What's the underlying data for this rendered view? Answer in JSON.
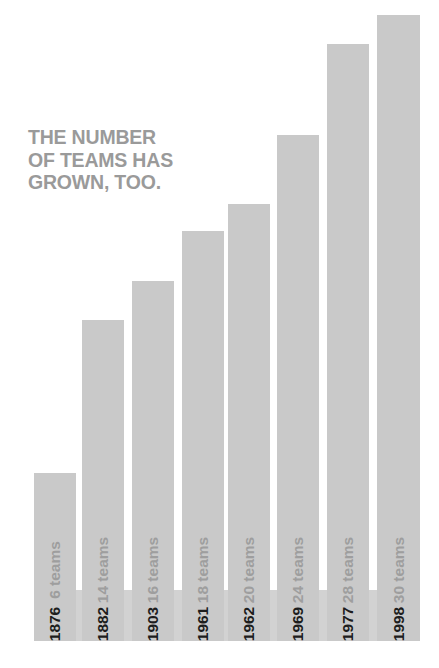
{
  "chart_data": {
    "type": "bar",
    "title": "THE NUMBER\nOF TEAMS HAS\nGROWN, TOO.",
    "xlabel": "",
    "ylabel": "",
    "ylim": [
      0,
      30
    ],
    "grid": false,
    "legend": null,
    "orientation": "vertical",
    "categories": [
      "1876",
      "1882",
      "1903",
      "1961",
      "1962",
      "1969",
      "1977",
      "1998"
    ],
    "values": [
      6,
      14,
      16,
      18,
      20,
      24,
      28,
      30
    ],
    "value_labels": [
      "6 teams",
      "14 teams",
      "16 teams",
      "18 teams",
      "20 teams",
      "24 teams",
      "28 teams",
      "30 teams"
    ],
    "bars": [
      {
        "year": "1876",
        "value": 6,
        "value_label": "6 teams",
        "x": 34,
        "width": 42,
        "top": 473,
        "bottom": 641
      },
      {
        "year": "1882",
        "value": 14,
        "value_label": "14 teams",
        "x": 82,
        "width": 42,
        "top": 320,
        "bottom": 641
      },
      {
        "year": "1903",
        "value": 16,
        "value_label": "16 teams",
        "x": 132,
        "width": 42,
        "top": 281,
        "bottom": 641
      },
      {
        "year": "1961",
        "value": 18,
        "value_label": "18 teams",
        "x": 182,
        "width": 42,
        "top": 231,
        "bottom": 641
      },
      {
        "year": "1962",
        "value": 20,
        "value_label": "20 teams",
        "x": 228,
        "width": 42,
        "top": 204,
        "bottom": 641
      },
      {
        "year": "1969",
        "value": 24,
        "value_label": "24 teams",
        "x": 277,
        "width": 42,
        "top": 135,
        "bottom": 641
      },
      {
        "year": "1977",
        "value": 28,
        "value_label": "28 teams",
        "x": 327,
        "width": 42,
        "top": 44,
        "bottom": 641
      },
      {
        "year": "1998",
        "value": 30,
        "value_label": "30 teams",
        "x": 377,
        "width": 43,
        "top": 15,
        "bottom": 641
      }
    ],
    "colors": {
      "background": "#ffffff",
      "bar_fill": "#c9c9c9",
      "year_band": "#d2d2d2",
      "title_text": "#9a9a9a",
      "value_label_text": "#9e9e9e",
      "year_label_text": "#1d1d1d"
    }
  }
}
